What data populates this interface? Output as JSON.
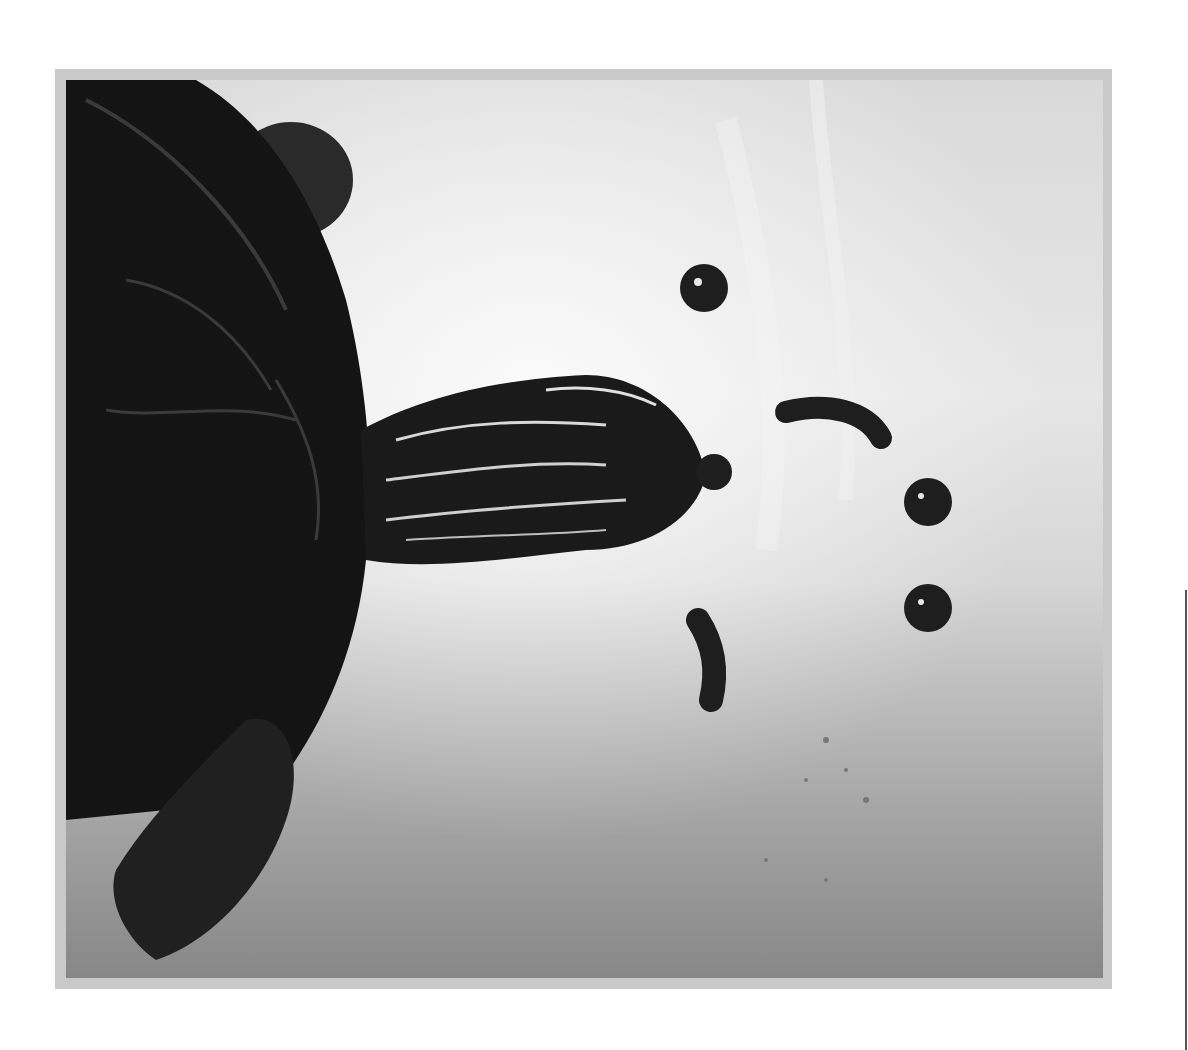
{
  "image": {
    "subject": "Turtle swimming in water with food pellets",
    "style": "black-and-white photograph",
    "colors": {
      "page_background": "#ffffff",
      "frame": "#c9c9c9",
      "water_light": "#e6e6e6",
      "water_dark": "#b4b4b4",
      "turtle": "#141414",
      "pellet": "#1e1e1e"
    },
    "elements": [
      "turtle-shell",
      "turtle-head",
      "front-flipper",
      "rear-flipper",
      "food-pellets",
      "worm-pieces"
    ]
  }
}
